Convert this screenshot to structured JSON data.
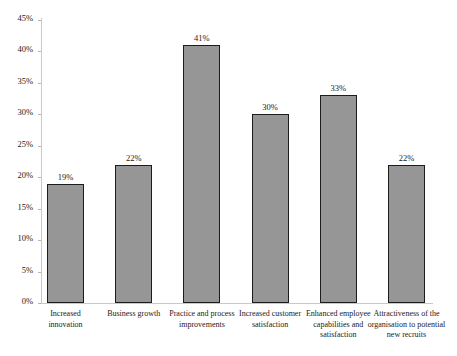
{
  "chart_data": {
    "type": "bar",
    "title": "",
    "subtitle": "",
    "xlabel": "",
    "ylabel": "",
    "ylim": [
      0,
      45
    ],
    "ytick_values": [
      0,
      5,
      10,
      15,
      20,
      25,
      30,
      35,
      40,
      45
    ],
    "ytick_labels": [
      "0%",
      "5%",
      "10%",
      "15%",
      "20%",
      "25%",
      "30%",
      "35%",
      "40%",
      "45%"
    ],
    "grid": false,
    "legend": null,
    "categories": [
      "Increased innovation",
      "Business growth",
      "Practice and process improvements",
      "Increased customer satisfaction",
      "Enhanced employee capabilities and satisfaction",
      "Attractiveness of the organisation to potential new recruits"
    ],
    "values": [
      19,
      22,
      41,
      30,
      33,
      22
    ],
    "value_labels": [
      "19%",
      "22%",
      "41%",
      "30%",
      "33%",
      "22%"
    ],
    "bar_color": "#969696",
    "bar_border_color": "#1c1c1c",
    "axis_color": "#c9c9c9",
    "background_color": "#ffffff"
  },
  "axis": {
    "ticks": [
      {
        "label": "45%",
        "value": 45
      },
      {
        "label": "40%",
        "value": 40
      },
      {
        "label": "35%",
        "value": 35
      },
      {
        "label": "30%",
        "value": 30
      },
      {
        "label": "25%",
        "value": 25
      },
      {
        "label": "20%",
        "value": 20
      },
      {
        "label": "15%",
        "value": 15
      },
      {
        "label": "10%",
        "value": 10
      },
      {
        "label": "5%",
        "value": 5
      },
      {
        "label": "0%",
        "value": 0
      }
    ]
  },
  "bars": [
    {
      "label": "Increased innovation",
      "value": 19,
      "value_label": "19%"
    },
    {
      "label": "Business growth",
      "value": 22,
      "value_label": "22%"
    },
    {
      "label": "Practice and process improvements",
      "value": 41,
      "value_label": "41%"
    },
    {
      "label": "Increased customer satisfaction",
      "value": 30,
      "value_label": "30%"
    },
    {
      "label": "Enhanced employee capabilities and satisfaction",
      "value": 33,
      "value_label": "33%"
    },
    {
      "label": "Attractiveness of the organisation to potential new recruits",
      "value": 22,
      "value_label": "22%"
    }
  ]
}
